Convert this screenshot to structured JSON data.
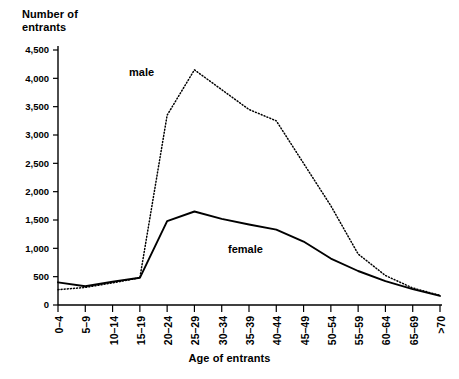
{
  "chart_data": {
    "type": "line",
    "title": "",
    "ylabel": "Number of\nentrants",
    "xlabel": "Age of entrants",
    "categories": [
      "0–4",
      "5–9",
      "10–14",
      "15–19",
      "20–24",
      "25–29",
      "30–34",
      "35–39",
      "40–44",
      "45–49",
      "50–54",
      "55–59",
      "60–64",
      "65–69",
      ">70"
    ],
    "series": [
      {
        "name": "male",
        "style": "dotted",
        "values": [
          270,
          310,
          390,
          480,
          3350,
          4150,
          3800,
          3450,
          3250,
          2500,
          1750,
          900,
          520,
          300,
          170
        ]
      },
      {
        "name": "female",
        "style": "solid",
        "values": [
          400,
          330,
          410,
          480,
          1480,
          1650,
          1520,
          1420,
          1330,
          1120,
          820,
          600,
          420,
          280,
          160
        ]
      }
    ],
    "ylim": [
      0,
      4500
    ],
    "yticks": [
      0,
      500,
      1000,
      1500,
      2000,
      2500,
      3000,
      3500,
      4000,
      4500
    ],
    "ytick_labels": [
      "0",
      "500",
      "1,000",
      "1,500",
      "2,000",
      "2,500",
      "3,000",
      "3,500",
      "4,000",
      "4,500"
    ],
    "grid": false,
    "legend_position": "inline-annotations",
    "annotations": [
      {
        "name": "male",
        "text": "male"
      },
      {
        "name": "female",
        "text": "female"
      }
    ]
  },
  "axes": {
    "y_title_line1": "Number of",
    "y_title_line2": "entrants",
    "x_title": "Age of entrants"
  },
  "caption": {
    "partial_text": ""
  }
}
